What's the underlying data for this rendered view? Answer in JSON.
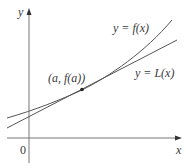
{
  "figure": {
    "axes": {
      "x_label": "x",
      "y_label": "y",
      "origin_label": "0"
    },
    "curves": [
      {
        "name": "f",
        "label": "y = f(x)",
        "color": "#555555"
      },
      {
        "name": "L",
        "label": "y = L(x)",
        "color": "#555555"
      }
    ],
    "point": {
      "label": "(a, f(a))",
      "color": "#222222"
    }
  }
}
